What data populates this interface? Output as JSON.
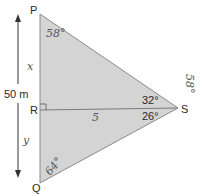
{
  "diagram": {
    "type": "triangle-geometry",
    "colors": {
      "fill": "#d4d4d4",
      "stroke": "#8a8a8a",
      "text": "#2a2a2a",
      "handwriting": "#555555"
    },
    "vertices": {
      "P": "P",
      "R": "R",
      "Q": "Q",
      "S": "S"
    },
    "dimension": {
      "label": "50 m",
      "direction": "vertical double arrow from P to Q"
    },
    "angles": {
      "upper_at_S": "32°",
      "lower_at_S": "26°",
      "right_angle_at_R": "right-angle-marker"
    },
    "handwritten": {
      "angle_at_P": "58°",
      "segment_PR": "x",
      "segment_RQ": "y",
      "angle_at_Q": "64°",
      "segment_RS": "5",
      "note_near_S": "58°"
    }
  }
}
